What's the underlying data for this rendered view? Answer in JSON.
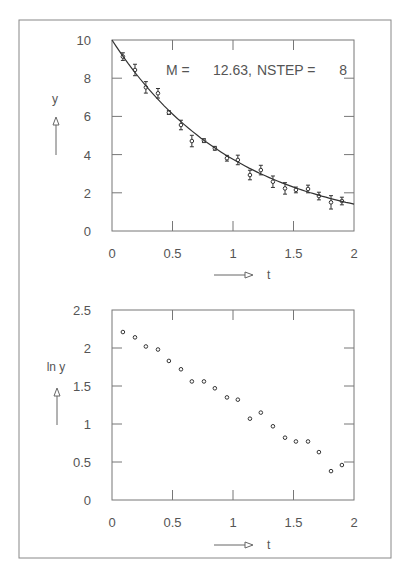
{
  "figure": {
    "frame_color": "#777777",
    "ink_color": "#333333",
    "label_color": "#666666"
  },
  "chart_data": [
    {
      "type": "scatter",
      "title": "",
      "annotation": "M =   12.63, NSTEP =     8",
      "annotation_parts": {
        "m_label": "M  =",
        "m_value": "12.63,",
        "nstep_label": "NSTEP  =",
        "nstep_value": "8"
      },
      "xlabel": "t",
      "ylabel": "y",
      "xlim": [
        0,
        2
      ],
      "ylim": [
        0,
        10
      ],
      "xticks": [
        0,
        0.5,
        1,
        1.5,
        2
      ],
      "xtick_labels": [
        "0",
        "0.5",
        "1",
        "1.5",
        "2"
      ],
      "yticks": [
        0,
        2,
        4,
        6,
        8,
        10
      ],
      "ytick_labels": [
        "0",
        "2",
        "4",
        "6",
        "8",
        "10"
      ],
      "grid": false,
      "legend": null,
      "series": [
        {
          "name": "measurements",
          "style": "points-with-error-bars",
          "x": [
            0.09,
            0.19,
            0.28,
            0.38,
            0.47,
            0.57,
            0.66,
            0.76,
            0.85,
            0.95,
            1.04,
            1.14,
            1.23,
            1.33,
            1.43,
            1.52,
            1.62,
            1.71,
            1.81,
            1.9
          ],
          "y": [
            9.13,
            8.43,
            7.52,
            7.21,
            6.2,
            5.55,
            4.71,
            4.73,
            4.33,
            3.81,
            3.72,
            2.93,
            3.19,
            2.58,
            2.23,
            2.15,
            2.2,
            1.83,
            1.5,
            1.57
          ],
          "yerr": [
            0.2,
            0.3,
            0.3,
            0.25,
            0.1,
            0.25,
            0.3,
            0.1,
            0.1,
            0.15,
            0.25,
            0.25,
            0.25,
            0.3,
            0.3,
            0.15,
            0.2,
            0.2,
            0.35,
            0.2
          ]
        },
        {
          "name": "fit",
          "style": "line",
          "function": "y = 10 * exp(-0.98 t)",
          "x": [
            0,
            0.25,
            0.5,
            0.75,
            1.0,
            1.25,
            1.5,
            1.75,
            2.0
          ],
          "y": [
            10.0,
            7.83,
            6.13,
            4.8,
            3.75,
            2.94,
            2.3,
            1.8,
            1.41
          ]
        }
      ]
    },
    {
      "type": "scatter",
      "title": "",
      "xlabel": "t",
      "ylabel": "ln y",
      "xlim": [
        0,
        2
      ],
      "ylim": [
        0,
        2.5
      ],
      "xticks": [
        0,
        0.5,
        1,
        1.5,
        2
      ],
      "xtick_labels": [
        "0",
        "0.5",
        "1",
        "1.5",
        "2"
      ],
      "yticks": [
        0,
        0.5,
        1,
        1.5,
        2,
        2.5
      ],
      "ytick_labels": [
        "0",
        "0.5",
        "1",
        "1.5",
        "2",
        "2.5"
      ],
      "grid": false,
      "legend": null,
      "series": [
        {
          "name": "ln y",
          "style": "points",
          "x": [
            0.09,
            0.19,
            0.28,
            0.38,
            0.47,
            0.57,
            0.66,
            0.76,
            0.85,
            0.95,
            1.04,
            1.14,
            1.23,
            1.33,
            1.43,
            1.52,
            1.62,
            1.71,
            1.81,
            1.9
          ],
          "y": [
            2.21,
            2.14,
            2.02,
            1.98,
            1.83,
            1.72,
            1.56,
            1.56,
            1.47,
            1.35,
            1.32,
            1.07,
            1.15,
            0.97,
            0.82,
            0.77,
            0.77,
            0.63,
            0.38,
            0.46
          ]
        }
      ]
    }
  ]
}
